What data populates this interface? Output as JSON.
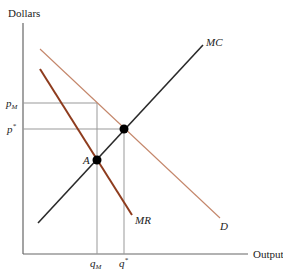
{
  "diagram": {
    "type": "economics-monopoly",
    "y_axis_label": "Dollars",
    "x_axis_label": "Output",
    "curves": [
      {
        "name": "MC",
        "label": "MC",
        "color": "#2a2a2a"
      },
      {
        "name": "D",
        "label": "D",
        "color": "#c4866a"
      },
      {
        "name": "MR",
        "label": "MR",
        "color": "#8e3c1e"
      }
    ],
    "points": [
      {
        "name": "A",
        "label": "A",
        "description": "MR = MC intersection"
      },
      {
        "name": "competitive-equilibrium",
        "label": "",
        "description": "D = MC intersection"
      }
    ],
    "y_ticks": [
      {
        "label_main": "p",
        "label_sub": "M"
      },
      {
        "label_main": "p",
        "label_sup": "*"
      }
    ],
    "x_ticks": [
      {
        "label_main": "q",
        "label_sub": "M"
      },
      {
        "label_main": "q",
        "label_sup": "*"
      }
    ],
    "colors": {
      "axis": "#555555",
      "guide": "#888888",
      "point": "#000000"
    }
  }
}
